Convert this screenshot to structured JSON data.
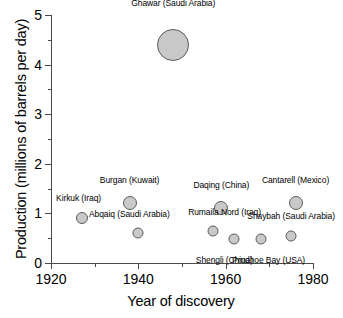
{
  "chart_data": {
    "type": "scatter",
    "title": "",
    "xlabel": "Year of discovery",
    "ylabel": "Production (millions of barrels per day)",
    "xlim": [
      1920,
      1980
    ],
    "ylim": [
      0,
      5
    ],
    "xticks": [
      1920,
      1940,
      1960,
      1980
    ],
    "xticks_minor": [
      1930,
      1950,
      1970
    ],
    "yticks": [
      0,
      1,
      2,
      3,
      4,
      5
    ],
    "yticks_minor": [
      0.5,
      1.5,
      2.5,
      3.5,
      4.5
    ],
    "grid": false,
    "legend": "none",
    "bubble_color": "#c9c9c9",
    "bubble_edge_color": "#5c5c5c",
    "axis_color": "#4a4a4a",
    "points": [
      {
        "name": "Ghawar (Saudi Arabia)",
        "x": 1948,
        "y": 4.4,
        "r": 16,
        "label_dx": 0,
        "label_dy": -26
      },
      {
        "name": "Kirkuk (Iraq)",
        "x": 1927,
        "y": 0.9,
        "r": 6,
        "label_dx": -3,
        "label_dy": -14
      },
      {
        "name": "Burgan (Kuwait)",
        "x": 1938,
        "y": 1.2,
        "r": 7,
        "label_dx": 0,
        "label_dy": -16
      },
      {
        "name": "Abqaiq (Saudi Arabia)",
        "x": 1940,
        "y": 0.6,
        "r": 5.5,
        "label_dx": -9,
        "label_dy": -14
      },
      {
        "name": "Daqing (China)",
        "x": 1959,
        "y": 1.1,
        "r": 7,
        "label_dx": 0,
        "label_dy": -16
      },
      {
        "name": "Rumaila Nord (Iraq)",
        "x": 1957,
        "y": 0.65,
        "r": 5.5,
        "label_dx": 12,
        "label_dy": -13
      },
      {
        "name": "Shengli (China)",
        "x": 1962,
        "y": 0.48,
        "r": 5.5,
        "label_dx": -10,
        "label_dy": 15
      },
      {
        "name": "Prudhoe Bay (USA)",
        "x": 1968,
        "y": 0.48,
        "r": 5.5,
        "label_dx": 8,
        "label_dy": 15
      },
      {
        "name": "Shaybah (Saudi Arabia)",
        "x": 1975,
        "y": 0.55,
        "r": 5.5,
        "label_dx": 0,
        "label_dy": -14
      },
      {
        "name": "Cantarell (Mexico)",
        "x": 1976,
        "y": 1.2,
        "r": 7,
        "label_dx": 0,
        "label_dy": -16
      }
    ]
  }
}
